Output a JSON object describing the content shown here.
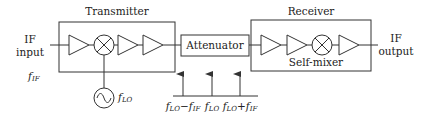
{
  "diagram": {
    "transmitter": {
      "title": "Transmitter",
      "chain": [
        "amplifier",
        "mixer",
        "amplifier",
        "amplifier"
      ]
    },
    "receiver": {
      "title": "Receiver",
      "chain": [
        "amplifier",
        "amplifier",
        "mixer",
        "amplifier"
      ],
      "mixer_label": "Self-mixer"
    },
    "attenuator": {
      "label": "Attenuator"
    },
    "input": {
      "line1": "IF",
      "line2": "input",
      "freq_symbol": "f",
      "freq_sub": "IF"
    },
    "output": {
      "line1": "IF",
      "line2": "output"
    },
    "local_oscillator": {
      "symbol": "f",
      "sub": "LO",
      "icon": "sine-source-icon"
    },
    "spectrum": {
      "tones": [
        {
          "parts": [
            {
              "t": "f",
              "k": "f"
            },
            {
              "t": "LO",
              "k": "s"
            },
            {
              "t": "−",
              "k": "n"
            },
            {
              "t": "f",
              "k": "f"
            },
            {
              "t": "IF",
              "k": "s"
            }
          ]
        },
        {
          "parts": [
            {
              "t": "f",
              "k": "f"
            },
            {
              "t": "LO",
              "k": "s"
            }
          ]
        },
        {
          "parts": [
            {
              "t": "f",
              "k": "f"
            },
            {
              "t": "LO",
              "k": "s"
            },
            {
              "t": "+",
              "k": "n"
            },
            {
              "t": "f",
              "k": "f"
            },
            {
              "t": "IF",
              "k": "s"
            }
          ]
        }
      ]
    }
  }
}
